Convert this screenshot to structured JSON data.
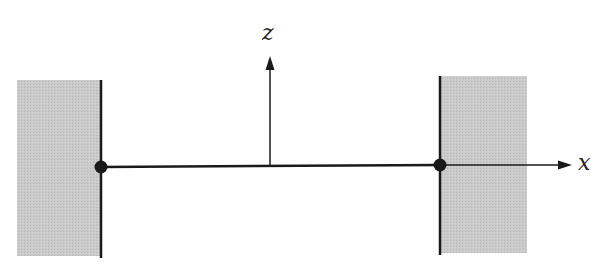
{
  "diagram": {
    "axes": {
      "x_label": "x",
      "z_label": "z"
    },
    "colors": {
      "wall_fill": "#c8c8c8",
      "line": "#1a1a1a",
      "background": "#ffffff"
    },
    "elements": [
      {
        "type": "wall",
        "side": "left"
      },
      {
        "type": "wall",
        "side": "right"
      },
      {
        "type": "support-point",
        "side": "left"
      },
      {
        "type": "support-point",
        "side": "right"
      },
      {
        "type": "string",
        "from": "left-support",
        "to": "right-support"
      }
    ]
  }
}
